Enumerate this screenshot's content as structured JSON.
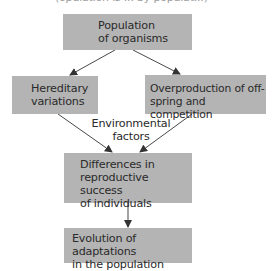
{
  "diagram": {
    "top_cutoff_text": "(opulation is ... by populat...)",
    "nodes": {
      "population": {
        "lines": [
          "Population",
          "of organisms"
        ]
      },
      "hereditary": {
        "lines": [
          "Hereditary",
          "variations"
        ]
      },
      "overproduction": {
        "lines": [
          "Overproduction of off-",
          "spring and competition"
        ]
      },
      "differences": {
        "lines": [
          "Differences in",
          "reproductive success",
          "of individuals"
        ]
      },
      "evolution": {
        "lines": [
          "Evolution of adaptations",
          "in the population"
        ]
      }
    },
    "edge_label": {
      "lines": [
        "Environmental",
        "factors"
      ]
    },
    "edges": [
      {
        "from": "population",
        "to": "hereditary"
      },
      {
        "from": "population",
        "to": "overproduction"
      },
      {
        "from": "hereditary",
        "to": "differences"
      },
      {
        "from": "overproduction",
        "to": "differences"
      },
      {
        "from": "differences",
        "to": "evolution"
      }
    ],
    "colors": {
      "box_fill": "#b4b4b4",
      "text": "#2a2a2a",
      "arrow": "#333333"
    }
  }
}
